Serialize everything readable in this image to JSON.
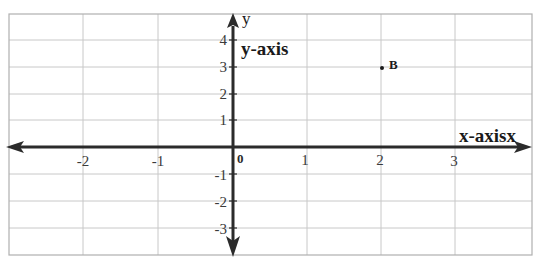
{
  "diagram": {
    "type": "cartesian-coordinate-plane",
    "x_axis": {
      "title": "x-axisx",
      "range": [
        -3,
        4
      ],
      "tick_labels": [
        "-2",
        "-1",
        "1",
        "2",
        "3"
      ],
      "tick_values": [
        -2,
        -1,
        1,
        2,
        3
      ]
    },
    "y_axis": {
      "letter": "y",
      "title": "y-axis",
      "range": [
        -4,
        5
      ],
      "tick_labels_positive": [
        "4",
        "3",
        "2",
        "1"
      ],
      "tick_labels_negative": [
        "-1",
        "-2",
        "-3"
      ]
    },
    "origin_label": "0",
    "points": [
      {
        "label": "B",
        "x": 2,
        "y": 3
      }
    ],
    "colors": {
      "axis": "#2b2b2b",
      "grid": "#c8c8c8",
      "border": "#b0b0b0",
      "text": "#1a1a1a"
    }
  }
}
